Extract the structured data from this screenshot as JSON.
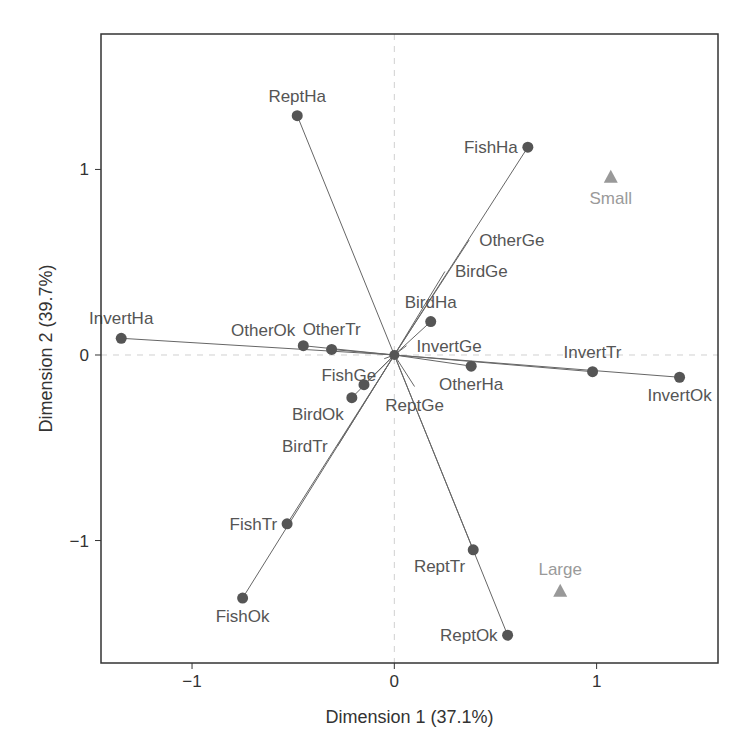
{
  "chart_data": {
    "type": "scatter",
    "title": "",
    "xlabel": "Dimension 1 (37.1%)",
    "ylabel": "Dimension 2 (39.7%)",
    "xlim": [
      -1.45,
      1.6
    ],
    "ylim": [
      -1.66,
      1.73
    ],
    "xticks": [
      {
        "value": -1,
        "label": "−1"
      },
      {
        "value": 0,
        "label": "0"
      },
      {
        "value": 1,
        "label": "1"
      }
    ],
    "yticks": [
      {
        "value": -1,
        "label": "−1"
      },
      {
        "value": 0,
        "label": "0"
      },
      {
        "value": 1,
        "label": "1"
      }
    ],
    "grid": false,
    "reference_lines": {
      "x": 0,
      "y": 0,
      "style": "dashed"
    },
    "colors": {
      "points": "#555555",
      "arrows": "#666666",
      "supplementary": "#999999",
      "frame": "#333333",
      "reference": "#d0d0d0"
    },
    "series": [
      {
        "name": "variables",
        "marker": "circle",
        "points": [
          {
            "label": "ReptHa",
            "x": -0.48,
            "y": 1.29,
            "dot": true,
            "label_pos": "above"
          },
          {
            "label": "FishHa",
            "x": 0.66,
            "y": 1.12,
            "dot": true,
            "label_pos": "left"
          },
          {
            "label": "OtherGe",
            "x": 0.37,
            "y": 0.62,
            "dot": false,
            "label_pos": "right"
          },
          {
            "label": "BirdGe",
            "x": 0.25,
            "y": 0.45,
            "dot": false,
            "label_pos": "right"
          },
          {
            "label": "BirdHa",
            "x": 0.18,
            "y": 0.18,
            "dot": true,
            "label_pos": "above"
          },
          {
            "label": "InvertGe",
            "x": 0.06,
            "y": 0.05,
            "dot": false,
            "label_pos": "right"
          },
          {
            "label": "InvertHa",
            "x": -1.35,
            "y": 0.09,
            "dot": true,
            "label_pos": "above"
          },
          {
            "label": "OtherOk",
            "x": -0.45,
            "y": 0.05,
            "dot": true,
            "label_pos": "aboveleft"
          },
          {
            "label": "OtherTr",
            "x": -0.31,
            "y": 0.03,
            "dot": true,
            "label_pos": "above"
          },
          {
            "label": "FishGe",
            "x": -0.05,
            "y": -0.02,
            "dot": false,
            "label_pos": "belowleft"
          },
          {
            "label": "OtherHa",
            "x": 0.38,
            "y": -0.06,
            "dot": true,
            "label_pos": "below"
          },
          {
            "label": "InvertTr",
            "x": 0.98,
            "y": -0.09,
            "dot": true,
            "label_pos": "above"
          },
          {
            "label": "InvertOk",
            "x": 1.41,
            "y": -0.12,
            "dot": true,
            "label_pos": "below"
          },
          {
            "label": "ReptGe",
            "x": 0.1,
            "y": -0.17,
            "dot": false,
            "label_pos": "below"
          },
          {
            "label": "",
            "x": -0.15,
            "y": -0.16,
            "dot": true,
            "label_pos": "none"
          },
          {
            "label": "BirdOk",
            "x": -0.21,
            "y": -0.23,
            "dot": true,
            "label_pos": "belowleft"
          },
          {
            "label": "BirdTr",
            "x": -0.28,
            "y": -0.49,
            "dot": false,
            "label_pos": "left"
          },
          {
            "label": "FishTr",
            "x": -0.53,
            "y": -0.91,
            "dot": true,
            "label_pos": "left"
          },
          {
            "label": "FishOk",
            "x": -0.75,
            "y": -1.31,
            "dot": true,
            "label_pos": "below"
          },
          {
            "label": "ReptTr",
            "x": 0.39,
            "y": -1.05,
            "dot": true,
            "label_pos": "belowleft"
          },
          {
            "label": "ReptOk",
            "x": 0.56,
            "y": -1.51,
            "dot": true,
            "label_pos": "left"
          }
        ]
      },
      {
        "name": "supplementary",
        "marker": "triangle",
        "points": [
          {
            "label": "Small",
            "x": 1.07,
            "y": 0.96,
            "label_pos": "below"
          },
          {
            "label": "Large",
            "x": 0.82,
            "y": -1.27,
            "label_pos": "above"
          }
        ]
      }
    ]
  }
}
